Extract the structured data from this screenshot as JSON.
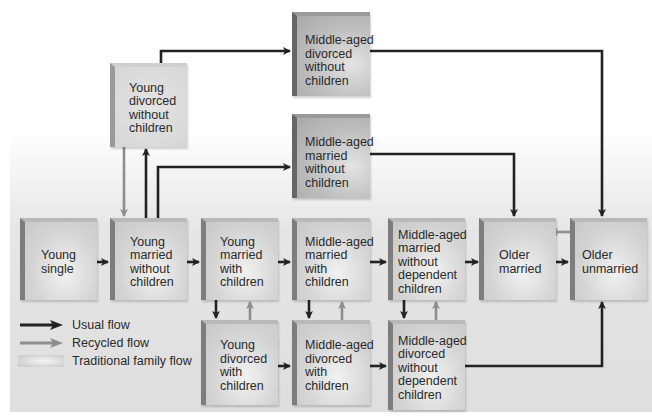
{
  "diagram": {
    "title_fragment": "(cut-off text at top)",
    "nodes": [
      {
        "id": "young_single",
        "lines": [
          "Young",
          "single"
        ]
      },
      {
        "id": "young_married_no_children",
        "lines": [
          "Young",
          "married",
          "without",
          "children"
        ]
      },
      {
        "id": "young_married_children",
        "lines": [
          "Young",
          "married",
          "with",
          "children"
        ]
      },
      {
        "id": "ma_married_children",
        "lines": [
          "Middle-aged",
          "married",
          "with",
          "children"
        ]
      },
      {
        "id": "ma_married_no_dependent",
        "lines": [
          "Middle-aged",
          "married",
          "without",
          "dependent",
          "children"
        ]
      },
      {
        "id": "older_married",
        "lines": [
          "Older",
          "married"
        ]
      },
      {
        "id": "older_unmarried",
        "lines": [
          "Older",
          "unmarried"
        ]
      },
      {
        "id": "young_divorced_no_children",
        "lines": [
          "Young",
          "divorced",
          "without",
          "children"
        ]
      },
      {
        "id": "ma_divorced_no_children",
        "lines": [
          "Middle-aged",
          "divorced",
          "without",
          "children"
        ]
      },
      {
        "id": "ma_married_no_children",
        "lines": [
          "Middle-aged",
          "married",
          "without",
          "children"
        ]
      },
      {
        "id": "young_divorced_children",
        "lines": [
          "Young",
          "divorced",
          "with",
          "children"
        ]
      },
      {
        "id": "ma_divorced_children",
        "lines": [
          "Middle-aged",
          "divorced",
          "with",
          "children"
        ]
      },
      {
        "id": "ma_divorced_no_dependent",
        "lines": [
          "Middle-aged",
          "divorced",
          "without",
          "dependent",
          "children"
        ]
      }
    ],
    "edges": [
      {
        "from": "young_single",
        "to": "young_married_no_children",
        "type": "usual"
      },
      {
        "from": "young_married_no_children",
        "to": "young_married_children",
        "type": "usual"
      },
      {
        "from": "young_married_children",
        "to": "ma_married_children",
        "type": "usual"
      },
      {
        "from": "ma_married_children",
        "to": "ma_married_no_dependent",
        "type": "usual"
      },
      {
        "from": "ma_married_no_dependent",
        "to": "older_married",
        "type": "usual"
      },
      {
        "from": "older_married",
        "to": "older_unmarried",
        "type": "usual"
      },
      {
        "from": "older_unmarried",
        "to": "older_married",
        "type": "recycled"
      },
      {
        "from": "young_married_no_children",
        "to": "young_divorced_no_children",
        "type": "usual"
      },
      {
        "from": "young_divorced_no_children",
        "to": "young_married_no_children",
        "type": "recycled"
      },
      {
        "from": "young_divorced_no_children",
        "to": "ma_divorced_no_children",
        "type": "usual"
      },
      {
        "from": "young_married_no_children",
        "to": "ma_married_no_children",
        "type": "usual"
      },
      {
        "from": "ma_divorced_no_children",
        "to": "older_unmarried",
        "type": "usual"
      },
      {
        "from": "ma_married_no_children",
        "to": "older_married",
        "type": "usual"
      },
      {
        "from": "young_married_children",
        "to": "young_divorced_children",
        "type": "usual"
      },
      {
        "from": "young_divorced_children",
        "to": "young_married_children",
        "type": "recycled"
      },
      {
        "from": "ma_married_children",
        "to": "ma_divorced_children",
        "type": "usual"
      },
      {
        "from": "ma_divorced_children",
        "to": "ma_married_children",
        "type": "recycled"
      },
      {
        "from": "ma_married_no_dependent",
        "to": "ma_divorced_no_dependent",
        "type": "usual"
      },
      {
        "from": "ma_divorced_no_dependent",
        "to": "ma_married_no_dependent",
        "type": "recycled"
      },
      {
        "from": "young_divorced_children",
        "to": "ma_divorced_children",
        "type": "usual"
      },
      {
        "from": "ma_divorced_children",
        "to": "ma_divorced_no_dependent",
        "type": "usual"
      },
      {
        "from": "ma_divorced_no_dependent",
        "to": "older_unmarried",
        "type": "usual"
      }
    ]
  },
  "legend": {
    "items": [
      {
        "label": "Usual flow",
        "kind": "usual-arrow"
      },
      {
        "label": "Recycled flow",
        "kind": "recycled-arrow"
      },
      {
        "label": "Traditional family flow",
        "kind": "gradient-swatch"
      }
    ]
  },
  "colors": {
    "usual_flow": "#222222",
    "recycled_flow": "#8e8e8e",
    "box_face": "#d0d0d0",
    "box_edge": "#7d7d7d"
  }
}
